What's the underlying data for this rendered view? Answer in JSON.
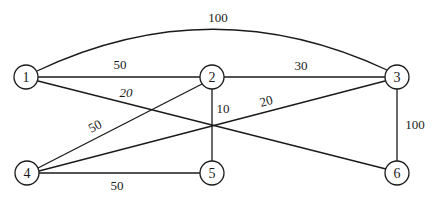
{
  "graph": {
    "nodes": [
      {
        "id": "1",
        "label": "1",
        "x": 26,
        "y": 77
      },
      {
        "id": "2",
        "label": "2",
        "x": 212,
        "y": 77
      },
      {
        "id": "3",
        "label": "3",
        "x": 397,
        "y": 77
      },
      {
        "id": "4",
        "label": "4",
        "x": 27,
        "y": 173
      },
      {
        "id": "5",
        "label": "5",
        "x": 212,
        "y": 173
      },
      {
        "id": "6",
        "label": "6",
        "x": 397,
        "y": 173
      }
    ],
    "edges": [
      {
        "from": "1",
        "to": "3",
        "weight": "100",
        "curved": true
      },
      {
        "from": "1",
        "to": "2",
        "weight": "50"
      },
      {
        "from": "1",
        "to": "6",
        "weight": "20"
      },
      {
        "from": "2",
        "to": "3",
        "weight": "30"
      },
      {
        "from": "2",
        "to": "5",
        "weight": "10"
      },
      {
        "from": "2",
        "to": "4",
        "weight": "50"
      },
      {
        "from": "4",
        "to": "3",
        "weight": "20"
      },
      {
        "from": "4",
        "to": "5",
        "weight": "50"
      },
      {
        "from": "3",
        "to": "6",
        "weight": "100"
      }
    ]
  },
  "labels": {
    "n1": "1",
    "n2": "2",
    "n3": "3",
    "n4": "4",
    "n5": "5",
    "n6": "6",
    "w13": "100",
    "w12": "50",
    "w16": "20",
    "w23": "30",
    "w25": "10",
    "w24": "50",
    "w43": "20",
    "w45": "50",
    "w36": "100"
  }
}
